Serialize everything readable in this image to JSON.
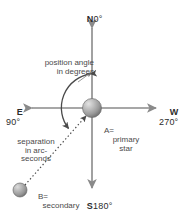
{
  "diagram": {
    "background_color": "#ffffff",
    "axis_color": "#8a8a8a",
    "text_color": "#3a3a3a",
    "star_color": "#8e8e8e",
    "cardinals": {
      "north": {
        "letter": "N",
        "degrees": "0°"
      },
      "south": {
        "letter": "S",
        "degrees": "180°"
      },
      "east": {
        "letter": "E",
        "degrees": "90°"
      },
      "west": {
        "letter": "W",
        "degrees": "270°"
      }
    },
    "annotations": {
      "position_angle": "position angle\nin degrees",
      "separation": "separation\nin arc-\nseconds"
    },
    "stars": {
      "primary": {
        "name": "A=",
        "description": "primary\nstar"
      },
      "secondary": {
        "name": "B=",
        "description": "secondary\nstar"
      }
    }
  }
}
